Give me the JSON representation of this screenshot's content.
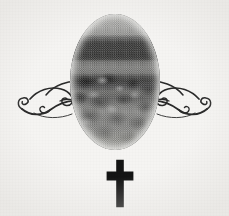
{
  "card": {
    "name": "memorial-ornament",
    "background_color": "#f5f4f2",
    "width": 229,
    "height": 216,
    "text_content": "",
    "notes": "no text is rendered in this image"
  },
  "ornament": {
    "portrait": {
      "name": "oval-portrait",
      "shape": "oval",
      "style": "halftone-photograph",
      "subject": "landscape with dark sky bands above textured ground",
      "ink_color": "#2b2b2b",
      "paper_color": "#f5f4f2",
      "bands": [
        {
          "label": "upper-sky-light",
          "tone": "#a8a8a6"
        },
        {
          "label": "dark-band-upper",
          "tone": "#343433"
        },
        {
          "label": "light-band-middle",
          "tone": "#848482"
        },
        {
          "label": "dark-band-lower",
          "tone": "#3b3b3a"
        },
        {
          "label": "mottled-ground",
          "tone": "#7c7c7a"
        },
        {
          "label": "lower-ground",
          "tone": "#9b9b97"
        }
      ]
    },
    "flourish_left": {
      "name": "scroll-flourish-left",
      "style": "calligraphic-scrollwork",
      "ink_color": "#2a2a2a"
    },
    "flourish_right": {
      "name": "scroll-flourish-right",
      "style": "calligraphic-scrollwork-mirrored",
      "ink_color": "#2a2a2a"
    },
    "cross": {
      "name": "latin-cross",
      "style": "solid-latin-cross",
      "color": "#141414"
    }
  }
}
